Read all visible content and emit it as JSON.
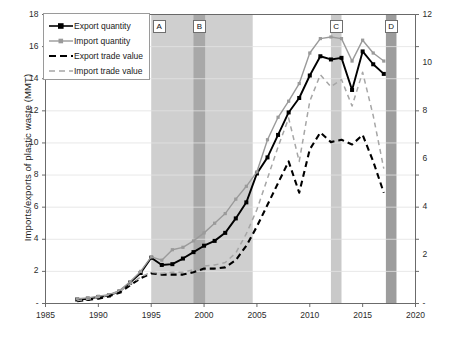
{
  "chart_data": {
    "type": "line",
    "title": "",
    "xlabel": "",
    "ylabel": "Imports/exports of plastic waste (MMT)",
    "ylabel_right": "Billion U.S. dollars",
    "xlim": [
      1985,
      2020
    ],
    "ylim": [
      0,
      18
    ],
    "ylim_right": [
      0,
      12
    ],
    "xticks": [
      "1985",
      "1990",
      "1995",
      "2000",
      "2005",
      "2010",
      "2015",
      "2020"
    ],
    "xtick_values": [
      1985,
      1990,
      1995,
      2000,
      2005,
      2010,
      2015,
      2020
    ],
    "yticks_left": [
      "-",
      "2",
      "4",
      "6",
      "8",
      "10",
      "12",
      "14",
      "16",
      "18"
    ],
    "ytick_left_values": [
      0,
      2,
      4,
      6,
      8,
      10,
      12,
      14,
      16,
      18
    ],
    "yticks_right": [
      "-",
      "2",
      "4",
      "6",
      "8",
      "10",
      "12"
    ],
    "ytick_right_values": [
      0,
      2,
      4,
      6,
      8,
      10,
      12
    ],
    "grid": true,
    "legend_position": "top-left",
    "x": [
      1988,
      1989,
      1990,
      1991,
      1992,
      1993,
      1994,
      1995,
      1996,
      1997,
      1998,
      1999,
      2000,
      2001,
      2002,
      2003,
      2004,
      2005,
      2006,
      2007,
      2008,
      2009,
      2010,
      2011,
      2012,
      2013,
      2014,
      2015,
      2016,
      2017
    ],
    "series": [
      {
        "name": "Export quantity",
        "axis": "left",
        "unit": "MMT",
        "color": "#000000",
        "style": "solid-marker",
        "values": [
          0.25,
          0.3,
          0.4,
          0.5,
          0.75,
          1.3,
          1.9,
          2.85,
          2.4,
          2.45,
          2.8,
          3.2,
          3.6,
          3.9,
          4.4,
          5.3,
          6.3,
          8.1,
          9.1,
          10.5,
          11.9,
          12.8,
          14.2,
          15.4,
          15.2,
          15.3,
          13.3,
          15.7,
          14.9,
          14.3
        ]
      },
      {
        "name": "Import quantity",
        "axis": "left",
        "unit": "MMT",
        "color": "#9a9a9a",
        "style": "solid-marker",
        "values": [
          0.3,
          0.35,
          0.45,
          0.55,
          0.8,
          1.35,
          2.0,
          2.9,
          2.7,
          3.35,
          3.5,
          3.9,
          4.4,
          5.0,
          5.6,
          6.5,
          7.3,
          8.2,
          10.2,
          11.6,
          12.6,
          13.7,
          15.6,
          16.5,
          16.6,
          16.5,
          15.1,
          16.4,
          15.6,
          15.1
        ]
      },
      {
        "name": "Export trade value",
        "axis": "right",
        "unit": "Billion U.S. dollars",
        "color": "#000000",
        "style": "dashed",
        "values": [
          0.1,
          0.15,
          0.2,
          0.3,
          0.45,
          0.75,
          1.05,
          1.25,
          1.2,
          1.2,
          1.2,
          1.3,
          1.45,
          1.45,
          1.5,
          1.8,
          2.4,
          3.2,
          4.1,
          5.0,
          5.9,
          4.6,
          6.4,
          7.1,
          6.7,
          6.8,
          6.6,
          7.0,
          5.9,
          4.6
        ]
      },
      {
        "name": "Import trade value",
        "axis": "right",
        "unit": "Billion U.S. dollars",
        "color": "#a6a6a6",
        "style": "dashed",
        "values": [
          0.12,
          0.18,
          0.25,
          0.35,
          0.5,
          0.8,
          1.1,
          1.3,
          1.25,
          1.3,
          1.3,
          1.4,
          1.55,
          1.6,
          1.7,
          2.1,
          2.9,
          3.9,
          5.2,
          6.5,
          7.7,
          5.9,
          8.4,
          9.5,
          9.0,
          9.3,
          8.2,
          9.6,
          7.8,
          5.6
        ]
      }
    ],
    "bands": [
      {
        "label": "A",
        "start": 1995.0,
        "end": 2004.6,
        "color": "#cfcfcf",
        "kind": "wide"
      },
      {
        "label": "B",
        "start": 1999.0,
        "end": 2000.1,
        "color": "#a8a8a8",
        "kind": "narrow"
      },
      {
        "label": "C",
        "start": 2012.0,
        "end": 2013.0,
        "color": "#c9c9c9",
        "kind": "narrow"
      },
      {
        "label": "D",
        "start": 2017.2,
        "end": 2018.2,
        "color": "#9d9d9d",
        "kind": "narrow"
      }
    ]
  },
  "legend": {
    "items": [
      {
        "label": "Export quantity"
      },
      {
        "label": "Import quantity"
      },
      {
        "label": "Export trade value"
      },
      {
        "label": "Import trade value"
      }
    ]
  }
}
